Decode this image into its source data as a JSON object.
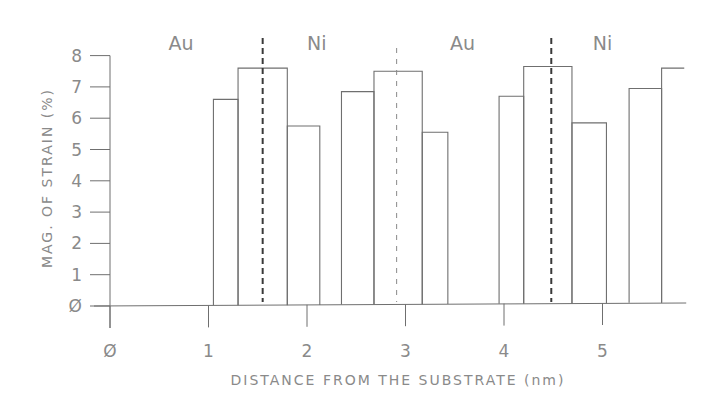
{
  "chart_data": {
    "type": "bar",
    "title": "",
    "xlabel": "DISTANCE FROM THE SUBSTRATE (nm)",
    "ylabel": "MAG. OF STRAIN (%)",
    "xlim": [
      0,
      5.85
    ],
    "ylim": [
      0,
      8
    ],
    "x_ticks": [
      0,
      1,
      2,
      3,
      4,
      5
    ],
    "y_ticks": [
      0,
      1,
      2,
      3,
      4,
      5,
      6,
      7,
      8
    ],
    "grid": false,
    "legend": null,
    "bars": [
      {
        "x0": 1.05,
        "x1": 1.3,
        "value": 6.6
      },
      {
        "x0": 1.3,
        "x1": 1.8,
        "value": 7.6
      },
      {
        "x0": 1.8,
        "x1": 2.13,
        "value": 5.75
      },
      {
        "x0": 2.35,
        "x1": 2.68,
        "value": 6.85
      },
      {
        "x0": 2.68,
        "x1": 3.17,
        "value": 7.5
      },
      {
        "x0": 3.17,
        "x1": 3.43,
        "value": 5.55
      },
      {
        "x0": 3.95,
        "x1": 4.2,
        "value": 6.7
      },
      {
        "x0": 4.2,
        "x1": 4.69,
        "value": 7.65
      },
      {
        "x0": 4.69,
        "x1": 5.04,
        "value": 5.85
      },
      {
        "x0": 5.27,
        "x1": 5.6,
        "value": 6.95
      },
      {
        "x0": 5.6,
        "x1": 5.83,
        "value": 7.6,
        "open_right": true
      }
    ],
    "interfaces": [
      {
        "x": 1.55,
        "style": "heavy-dashed"
      },
      {
        "x": 2.91,
        "style": "light-dashed"
      },
      {
        "x": 4.48,
        "style": "heavy-dashed"
      }
    ],
    "annotations": [
      {
        "text": "Au",
        "x": 0.72
      },
      {
        "text": "Ni",
        "x": 2.1
      },
      {
        "text": "Au",
        "x": 3.58
      },
      {
        "text": "Ni",
        "x": 5.0
      }
    ]
  }
}
